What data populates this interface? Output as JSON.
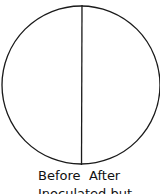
{
  "diagram": {
    "shape": "circle-split-vertical",
    "stroke_color": "#1a1a1a",
    "labels": {
      "left": "Before",
      "right": "After",
      "caption": "Inoculated  but"
    }
  }
}
